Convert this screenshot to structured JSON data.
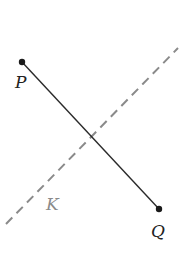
{
  "diagram": {
    "segment": {
      "start_label": "P",
      "end_label": "Q",
      "start": [
        22,
        62
      ],
      "end": [
        159,
        209
      ],
      "color": "#2a2a2a"
    },
    "line": {
      "label": "K",
      "style": "dashed",
      "from": [
        6,
        224
      ],
      "to": [
        178,
        48
      ],
      "color": "#8a8a8a"
    }
  }
}
